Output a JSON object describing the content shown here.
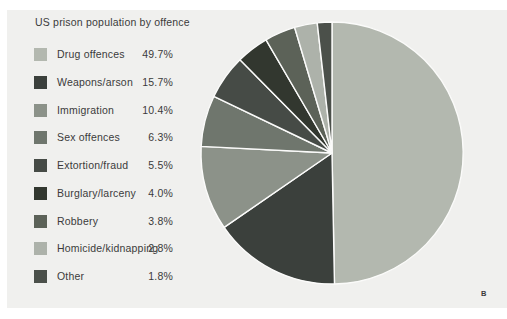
{
  "figure": {
    "panel_background": "#f0f0ee",
    "page_background": "#ffffff",
    "text_color": "#3b3b3b",
    "separator_color": "#fbfbfa",
    "annotation_label": "B"
  },
  "chart_data": {
    "type": "pie",
    "title": "US prison population by offence",
    "legend_position": "left",
    "start_angle_deg": 0,
    "direction": "clockwise",
    "center": {
      "x": 332,
      "y": 153
    },
    "radius": 131,
    "categories": [
      "Drug offences",
      "Weapons/arson",
      "Immigration",
      "Sex offences",
      "Extortion/fraud",
      "Burglary/larceny",
      "Robbery",
      "Homicide/kidnapping",
      "Other"
    ],
    "values": [
      49.7,
      15.7,
      10.4,
      6.3,
      5.5,
      4.0,
      3.8,
      2.8,
      1.8
    ],
    "value_labels": [
      "49.7%",
      "15.7%",
      "10.4%",
      "6.3%",
      "5.5%",
      "4.0%",
      "3.8%",
      "2.8%",
      "1.8%"
    ],
    "colors": [
      "#b3b8af",
      "#3b403c",
      "#8c9289",
      "#6f766d",
      "#464b46",
      "#32372f",
      "#5c6258",
      "#adb2aa",
      "#4b504a"
    ]
  }
}
